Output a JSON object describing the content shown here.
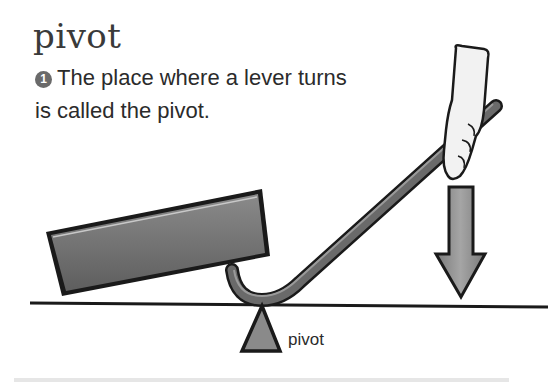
{
  "heading": {
    "title": "pivot"
  },
  "caption": {
    "number": "1",
    "text": "The place where a lever turns is called the pivot."
  },
  "figure": {
    "pivot_label": "pivot",
    "elements": [
      "load-block",
      "bent-lever-rod",
      "hand-pushing",
      "down-force-arrow",
      "ground-line",
      "pivot-triangle"
    ],
    "colors": {
      "ink": "#1a1a1a",
      "block_fill": "#707070",
      "rod_fill": "#5a5a5a",
      "arrow_fill": "#8a8a8a",
      "pivot_fill": "#8a8a8a",
      "hand_fill": "#f2f2f2"
    }
  }
}
